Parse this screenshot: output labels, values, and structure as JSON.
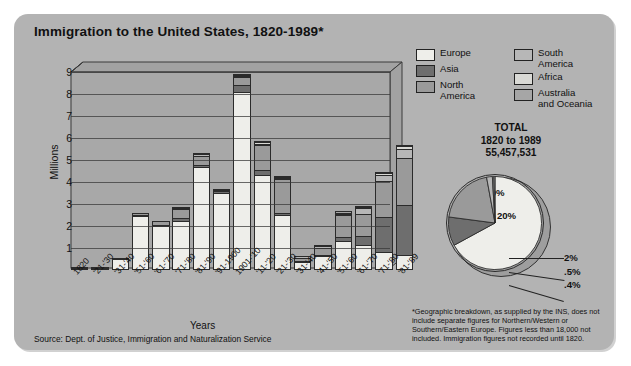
{
  "title": "Immigration to the United States, 1820-1989*",
  "source": "Source: Dept. of Justice, Immigration and Naturalization Service",
  "axis": {
    "ylabel": "Millions",
    "xlabel": "Years"
  },
  "legend": {
    "left": [
      {
        "label": "Europe",
        "color": "#eeeeea"
      },
      {
        "label": "Asia",
        "color": "#6e6e6e"
      },
      {
        "label": "North\nAmerica",
        "color": "#9a9a9a"
      }
    ],
    "right": [
      {
        "label": "South\nAmerica",
        "color": "#b7b7b7"
      },
      {
        "label": "Africa",
        "color": "#d9d9d5"
      },
      {
        "label": "Australia\nand Oceania",
        "color": "#a6a6a6"
      }
    ]
  },
  "total": {
    "line1": "TOTAL",
    "line2": "1820 to 1989",
    "line3": "55,457,531"
  },
  "note": "*Geographic breakdown, as supplied by the INS, does not include separate figures for Northern/Western or Southern/Eastern Europe. Figures less than 18,000 not included. Immigration figures not recorded until 1820.",
  "chart_data": {
    "type": "bar",
    "title": "Immigration to the United States, 1820-1989*",
    "xlabel": "Years",
    "ylabel": "Millions",
    "ylim": [
      0,
      9
    ],
    "yticks": [
      1,
      2,
      3,
      4,
      5,
      6,
      7,
      8,
      9
    ],
    "grid": true,
    "stacked": true,
    "legend_position": "top-right",
    "categories": [
      "1820",
      "'21-'30",
      "'31-'40",
      "'51-'60",
      "'61-'70",
      "'71-'80",
      "'81-'90",
      "'91-1900",
      "1901-'10",
      "'11-'20",
      "'21-'30",
      "'31-'40",
      "'41-'50",
      "'51-'60",
      "'61-'70",
      "'71-'80",
      "'81-'89"
    ],
    "series": [
      {
        "name": "Europe",
        "color": "#eeeeea",
        "values": [
          0.01,
          0.1,
          0.5,
          2.45,
          2.0,
          2.25,
          4.7,
          3.5,
          8.1,
          4.3,
          2.5,
          0.35,
          0.62,
          1.33,
          1.12,
          0.8,
          0.67
        ]
      },
      {
        "name": "Asia",
        "color": "#6e6e6e",
        "values": [
          0.0,
          0.0,
          0.0,
          0.04,
          0.06,
          0.12,
          0.07,
          0.07,
          0.3,
          0.25,
          0.11,
          0.02,
          0.03,
          0.15,
          0.43,
          1.59,
          2.3
        ]
      },
      {
        "name": "North America",
        "color": "#9a9a9a",
        "values": [
          0.01,
          0.03,
          0.06,
          0.09,
          0.15,
          0.4,
          0.43,
          0.04,
          0.36,
          1.14,
          1.52,
          0.16,
          0.35,
          1.0,
          1.0,
          1.65,
          2.12
        ]
      },
      {
        "name": "South America",
        "color": "#b7b7b7",
        "values": [
          0.0,
          0.0,
          0.0,
          0.0,
          0.0,
          0.01,
          0.01,
          0.01,
          0.02,
          0.04,
          0.04,
          0.01,
          0.02,
          0.08,
          0.26,
          0.3,
          0.4
        ]
      },
      {
        "name": "Africa",
        "color": "#d9d9d5",
        "values": [
          0.0,
          0.0,
          0.0,
          0.0,
          0.0,
          0.0,
          0.0,
          0.0,
          0.01,
          0.01,
          0.01,
          0.0,
          0.0,
          0.01,
          0.03,
          0.08,
          0.14
        ]
      },
      {
        "name": "Australia and Oceania",
        "color": "#a6a6a6",
        "values": [
          0.0,
          0.0,
          0.0,
          0.0,
          0.0,
          0.01,
          0.01,
          0.0,
          0.01,
          0.01,
          0.01,
          0.0,
          0.01,
          0.01,
          0.02,
          0.03,
          0.04
        ]
      }
    ]
  },
  "pie_data": {
    "type": "pie",
    "title": "TOTAL 1820 to 1989",
    "total": "55,457,531",
    "slices": [
      {
        "label": "Europe",
        "value": 67,
        "display": "67%",
        "color": "#eeeeea"
      },
      {
        "label": "Asia",
        "value": 10,
        "display": "10%",
        "color": "#6e6e6e"
      },
      {
        "label": "North America",
        "value": 20,
        "display": "20%",
        "color": "#9a9a9a"
      },
      {
        "label": "South America",
        "value": 2,
        "display": "2%",
        "color": "#b7b7b7"
      },
      {
        "label": "Africa",
        "value": 0.5,
        "display": ".5%",
        "color": "#d9d9d5"
      },
      {
        "label": "Australia and Oceania",
        "value": 0.4,
        "display": ".4%",
        "color": "#a6a6a6"
      }
    ]
  }
}
